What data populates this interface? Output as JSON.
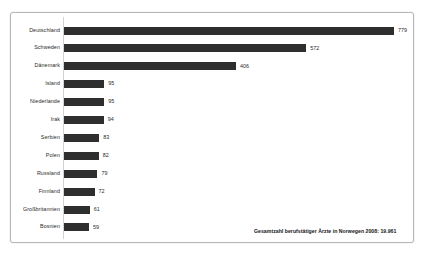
{
  "chart_data": {
    "type": "bar",
    "orientation": "horizontal",
    "title": "",
    "subtitle": "",
    "xlabel": "",
    "ylabel": "",
    "xlim": [
      0,
      779
    ],
    "grid": false,
    "legend": null,
    "categories": [
      "Deutschland",
      "Schweden",
      "Dänemark",
      "Island",
      "Niederlande",
      "Irak",
      "Serbien",
      "Polen",
      "Russland",
      "Finnland",
      "Großbritannien",
      "Bosnien"
    ],
    "values": [
      779,
      572,
      406,
      95,
      95,
      94,
      83,
      82,
      79,
      72,
      61,
      59
    ],
    "value_labels": [
      "779",
      "572",
      "406",
      "95",
      "95",
      "94",
      "83",
      "82",
      "79",
      "72",
      "61",
      "59"
    ],
    "annotation": "Gesamtzahl berufstätiger Ärzte in Norwegen 2008: 19.961",
    "bar_color": "#2e2e2e",
    "axis_color": "#d2d2d2",
    "frame_color": "#b6b6b6",
    "background_color": "#ffffff",
    "text_color": "#2b2b2b"
  }
}
